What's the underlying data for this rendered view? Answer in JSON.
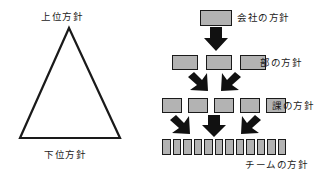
{
  "diagram": {
    "colors": {
      "box_fill": "#b3b3b3",
      "outline": "#1a1a1a",
      "arrow": "#111111",
      "background": "#ffffff"
    },
    "triangle": {
      "name": "policy-hierarchy-triangle",
      "top_label": "上位方針",
      "bottom_label": "下位方針"
    },
    "hierarchy": {
      "levels": [
        {
          "key": "company",
          "label": "会社の方針",
          "box_count": 1,
          "box_size": "wide"
        },
        {
          "key": "division",
          "label": "部の方針",
          "box_count": 3,
          "box_size": "mid"
        },
        {
          "key": "section",
          "label": "課の方針",
          "box_count": 5,
          "box_size": "small"
        },
        {
          "key": "team",
          "label": "チームの方針",
          "box_count": 12,
          "box_size": "tiny"
        }
      ],
      "arrow_groups": [
        {
          "key": "company-to-division",
          "arrows": [
            "down"
          ]
        },
        {
          "key": "division-to-section",
          "arrows": [
            "down-left",
            "down-right"
          ]
        },
        {
          "key": "section-to-team",
          "arrows": [
            "down-left",
            "down",
            "down-right"
          ]
        }
      ]
    }
  }
}
